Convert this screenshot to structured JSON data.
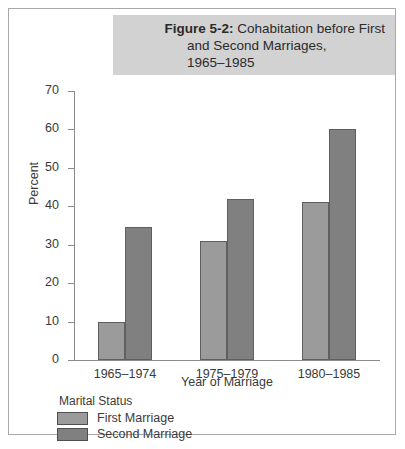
{
  "figure": {
    "title_label": "Figure 5-2:",
    "title_line_1": "Cohabitation before First",
    "title_line_2": "and Second Marriages,",
    "title_line_3": "1965–1985"
  },
  "legend": {
    "title": "Marital Status",
    "entries": [
      {
        "label": "First Marriage",
        "color": "#9b9b9b"
      },
      {
        "label": "Second Marriage",
        "color": "#808080"
      }
    ]
  },
  "chart_data": {
    "type": "bar",
    "title": "Figure 5-2: Cohabitation before First and Second Marriages, 1965–1985",
    "categories": [
      "1965–1974",
      "1975–1979",
      "1980–1985"
    ],
    "series": [
      {
        "name": "First Marriage",
        "values": [
          10,
          31,
          41
        ],
        "color": "#9b9b9b"
      },
      {
        "name": "Second Marriage",
        "values": [
          34.5,
          42,
          60
        ],
        "color": "#808080"
      }
    ],
    "xlabel": "Year of Marriage",
    "ylabel": "Percent",
    "ylim": [
      0,
      70
    ],
    "yticks": [
      0,
      10,
      20,
      30,
      40,
      50,
      60,
      70
    ],
    "ytick_labels": [
      "0",
      "10",
      "20",
      "30",
      "40",
      "50",
      "60",
      "70"
    ],
    "grid": false,
    "legend_position": "below-left",
    "legend_title": "Marital Status"
  }
}
